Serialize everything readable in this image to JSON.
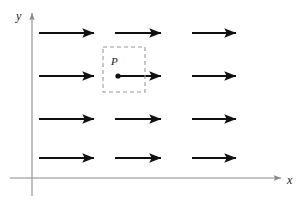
{
  "figure": {
    "width": 304,
    "height": 202,
    "background_color": "#ffffff"
  },
  "axes": {
    "color": "#8c8c8c",
    "x_axis": {
      "label": "x",
      "label_x": 287,
      "label_y": 174,
      "y": 178,
      "x_start": 10,
      "x_end": 281,
      "arrowhead": true
    },
    "y_axis": {
      "label": "y",
      "label_x": 16,
      "label_y": 10,
      "x": 32,
      "y_start": 196,
      "y_end": 13,
      "arrowhead": true
    }
  },
  "vector_field": {
    "color": "#111111",
    "direction": "positive-x",
    "line_width": 1.9,
    "rows_y": [
      33,
      76,
      119,
      158
    ],
    "columns": [
      {
        "x_start": 39,
        "x_end": 94
      },
      {
        "x_start": 115,
        "x_end": 161
      },
      {
        "x_start": 192,
        "x_end": 236
      }
    ],
    "arrows": [
      {
        "row": 0,
        "col": 0,
        "x_start": 39,
        "x_end": 94,
        "y": 33
      },
      {
        "row": 0,
        "col": 1,
        "x_start": 115,
        "x_end": 161,
        "y": 33
      },
      {
        "row": 0,
        "col": 2,
        "x_start": 192,
        "x_end": 236,
        "y": 33
      },
      {
        "row": 1,
        "col": 0,
        "x_start": 39,
        "x_end": 94,
        "y": 76
      },
      {
        "row": 1,
        "col": 1,
        "x_start": 118,
        "x_end": 161,
        "y": 76
      },
      {
        "row": 1,
        "col": 2,
        "x_start": 192,
        "x_end": 236,
        "y": 76
      },
      {
        "row": 2,
        "col": 0,
        "x_start": 39,
        "x_end": 94,
        "y": 119
      },
      {
        "row": 2,
        "col": 1,
        "x_start": 115,
        "x_end": 161,
        "y": 119
      },
      {
        "row": 2,
        "col": 2,
        "x_start": 192,
        "x_end": 236,
        "y": 119
      },
      {
        "row": 3,
        "col": 0,
        "x_start": 39,
        "x_end": 94,
        "y": 158
      },
      {
        "row": 3,
        "col": 1,
        "x_start": 115,
        "x_end": 161,
        "y": 158
      },
      {
        "row": 3,
        "col": 2,
        "x_start": 192,
        "x_end": 236,
        "y": 158
      }
    ]
  },
  "region": {
    "name": "dashed-region",
    "x": 103,
    "y": 47,
    "width": 42,
    "height": 45,
    "stroke_color": "#9a9a9a",
    "dash_pattern": "4 3"
  },
  "point": {
    "label": "P",
    "x": 118,
    "y": 76,
    "radius": 2.6,
    "color": "#111111",
    "label_x": 111,
    "label_y": 56
  }
}
